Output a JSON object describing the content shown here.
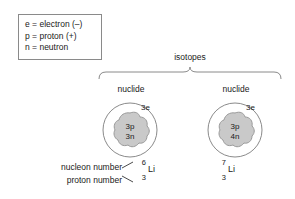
{
  "legend": {
    "name": "particle-key",
    "lines": [
      "e = electron (–)",
      "p = proton (+)",
      "n = neutron"
    ]
  },
  "grouping": {
    "bracket_label": "isotopes"
  },
  "columns": [
    {
      "heading": "nuclide",
      "atom": {
        "electrons": "3e",
        "protons": "3p",
        "neutrons": "3n"
      },
      "formula": {
        "mass_number": "6",
        "atomic_number": "3",
        "symbol": "Li"
      }
    },
    {
      "heading": "nuclide",
      "atom": {
        "electrons": "3e",
        "protons": "3p",
        "neutrons": "4n"
      },
      "formula": {
        "mass_number": "7",
        "atomic_number": "3",
        "symbol": "Li"
      }
    }
  ],
  "callouts": {
    "nucleon_number": "nucleon number",
    "proton_number": "proton number"
  },
  "colors": {
    "stroke": "#8a8a8a",
    "nucleus_fill": "#c9c9c9",
    "nucleus_stroke": "#9a9a9a",
    "text": "#1a1a1a",
    "background": "#ffffff"
  }
}
